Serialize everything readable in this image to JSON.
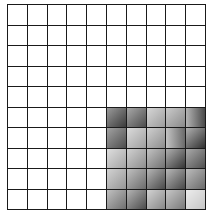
{
  "grid": {
    "rows": 10,
    "cols": 10,
    "line_color": "#1a1a1a",
    "empty_color": "#ffffff",
    "shaded_region": {
      "row_start": 5,
      "row_end": 9,
      "col_start": 5,
      "col_end": 9
    },
    "shaded_cells": [
      {
        "row": 5,
        "col": 5,
        "light": "#9a9a9a",
        "dark": "#3a3a3a",
        "dir": "135deg"
      },
      {
        "row": 5,
        "col": 6,
        "light": "#a8a8a8",
        "dark": "#4c4c4c",
        "dir": "135deg"
      },
      {
        "row": 5,
        "col": 7,
        "light": "#d6d6d6",
        "dark": "#9c9c9c",
        "dir": "135deg"
      },
      {
        "row": 5,
        "col": 8,
        "light": "#cacaca",
        "dark": "#8a8a8a",
        "dir": "135deg"
      },
      {
        "row": 5,
        "col": 9,
        "light": "#b4b4b4",
        "dark": "#4a4a4a",
        "dir": "90deg"
      },
      {
        "row": 6,
        "col": 5,
        "light": "#a2a2a2",
        "dark": "#4e4e4e",
        "dir": "135deg"
      },
      {
        "row": 6,
        "col": 6,
        "light": "#dadada",
        "dark": "#a0a0a0",
        "dir": "135deg"
      },
      {
        "row": 6,
        "col": 7,
        "light": "#cfcfcf",
        "dark": "#8e8e8e",
        "dir": "135deg"
      },
      {
        "row": 6,
        "col": 8,
        "light": "#c4c4c4",
        "dark": "#6a6a6a",
        "dir": "90deg"
      },
      {
        "row": 6,
        "col": 9,
        "light": "#b0b0b0",
        "dark": "#303030",
        "dir": "135deg"
      },
      {
        "row": 7,
        "col": 5,
        "light": "#dedede",
        "dark": "#a4a4a4",
        "dir": "135deg"
      },
      {
        "row": 7,
        "col": 6,
        "light": "#d0d0d0",
        "dark": "#8e8e8e",
        "dir": "135deg"
      },
      {
        "row": 7,
        "col": 7,
        "light": "#c2c2c2",
        "dark": "#727272",
        "dir": "135deg"
      },
      {
        "row": 7,
        "col": 8,
        "light": "#b0b0b0",
        "dark": "#363636",
        "dir": "135deg"
      },
      {
        "row": 7,
        "col": 9,
        "light": "#aaaaaa",
        "dark": "#505050",
        "dir": "135deg"
      },
      {
        "row": 8,
        "col": 5,
        "light": "#d2d2d2",
        "dark": "#969696",
        "dir": "135deg"
      },
      {
        "row": 8,
        "col": 6,
        "light": "#c0c0c0",
        "dark": "#6c6c6c",
        "dir": "135deg"
      },
      {
        "row": 8,
        "col": 7,
        "light": "#b6b6b6",
        "dark": "#4a4a4a",
        "dir": "135deg"
      },
      {
        "row": 8,
        "col": 8,
        "light": "#b8b8b8",
        "dark": "#484848",
        "dir": "135deg"
      },
      {
        "row": 8,
        "col": 9,
        "light": "#bcbcbc",
        "dark": "#6a6a6a",
        "dir": "135deg"
      },
      {
        "row": 9,
        "col": 5,
        "light": "#c0c0c0",
        "dark": "#707070",
        "dir": "135deg"
      },
      {
        "row": 9,
        "col": 6,
        "light": "#b4b4b4",
        "dark": "#4c4c4c",
        "dir": "135deg"
      },
      {
        "row": 9,
        "col": 7,
        "light": "#d2d2d2",
        "dark": "#888888",
        "dir": "135deg"
      },
      {
        "row": 9,
        "col": 8,
        "light": "#c6c6c6",
        "dark": "#7a7a7a",
        "dir": "135deg"
      },
      {
        "row": 9,
        "col": 9,
        "light": "#ececec",
        "dark": "#c6c6c6",
        "dir": "135deg"
      }
    ]
  }
}
